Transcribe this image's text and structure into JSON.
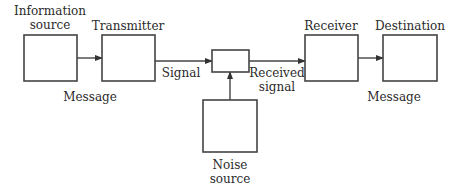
{
  "diagram": {
    "colors": {
      "stroke": "#444444",
      "text": "#2a2a2a",
      "background": "#ffffff"
    },
    "nodes": [
      {
        "id": "information-source",
        "label_lines": [
          "Information",
          "source"
        ],
        "box": [
          24,
          35,
          53,
          46
        ],
        "label_pos": [
          50,
          4
        ]
      },
      {
        "id": "transmitter",
        "label_lines": [
          "Transmitter"
        ],
        "box": [
          102,
          35,
          53,
          46
        ],
        "label_pos": [
          128,
          19
        ]
      },
      {
        "id": "channel",
        "label_lines": [],
        "box": [
          212,
          50,
          37,
          22
        ],
        "label_pos": null
      },
      {
        "id": "receiver",
        "label_lines": [
          "Receiver"
        ],
        "box": [
          305,
          35,
          53,
          46
        ],
        "label_pos": [
          331,
          19
        ]
      },
      {
        "id": "destination",
        "label_lines": [
          "Destination"
        ],
        "box": [
          383,
          35,
          54,
          46
        ],
        "label_pos": [
          410,
          19
        ]
      },
      {
        "id": "noise-source",
        "label_lines": [
          "Noise",
          "source"
        ],
        "box": [
          203,
          100,
          54,
          52
        ],
        "label_pos": [
          230,
          158
        ]
      }
    ],
    "edges": [
      {
        "from": "information-source",
        "to": "transmitter",
        "label_lines": [
          "Message"
        ],
        "label_pos": [
          90,
          90
        ]
      },
      {
        "from": "transmitter",
        "to": "channel",
        "label_lines": [
          "Signal"
        ],
        "label_pos": [
          181,
          66
        ]
      },
      {
        "from": "channel",
        "to": "receiver",
        "label_lines": [
          "Received",
          "signal"
        ],
        "label_pos": [
          277,
          66
        ]
      },
      {
        "from": "receiver",
        "to": "destination",
        "label_lines": [
          "Message"
        ],
        "label_pos": [
          394,
          90
        ]
      },
      {
        "from": "noise-source",
        "to": "channel",
        "label_lines": [],
        "label_pos": null
      }
    ]
  }
}
